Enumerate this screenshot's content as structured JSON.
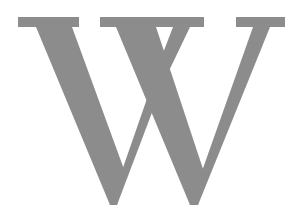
{
  "image": {
    "letter": "W",
    "description": "Large gray serif capital letter W on white background",
    "colors": {
      "glyph": "#8c8c8c",
      "background": "#ffffff"
    }
  }
}
